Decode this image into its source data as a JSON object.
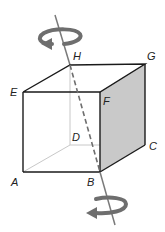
{
  "diagram": {
    "type": "cube-rotation",
    "vertices": {
      "A": "A",
      "B": "B",
      "C": "C",
      "D": "D",
      "E": "E",
      "F": "F",
      "G": "G",
      "H": "H"
    },
    "axis": "HB",
    "colors": {
      "edge": "#1a1a1a",
      "hidden_edge": "#c8c8c8",
      "shaded_face": "#c9c9c9",
      "axis": "#7a7a7a",
      "arrow": "#6e6e6e"
    }
  }
}
